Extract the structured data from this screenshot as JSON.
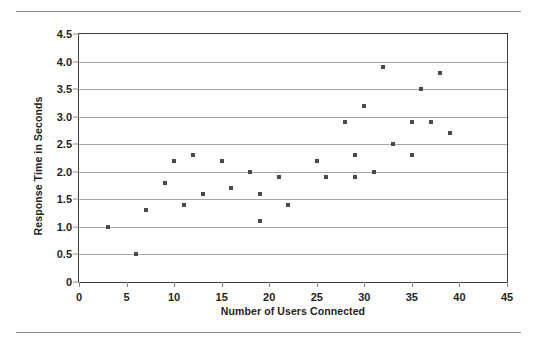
{
  "chart_data": {
    "type": "scatter",
    "title": "",
    "xlabel": "Number of Users Connected",
    "ylabel": "Response Time in Seconds",
    "xlim": [
      0,
      45
    ],
    "ylim": [
      0,
      4.5
    ],
    "xticks": [
      0,
      5,
      10,
      15,
      20,
      25,
      30,
      35,
      40,
      45
    ],
    "xtick_labels": [
      "0",
      "5",
      "10",
      "15",
      "20",
      "25",
      "30",
      "35",
      "40",
      "45"
    ],
    "yticks": [
      0,
      0.5,
      1.0,
      1.5,
      2.0,
      2.5,
      3.0,
      3.5,
      4.0,
      4.5
    ],
    "ytick_labels": [
      "0",
      "0.5",
      "1.0",
      "1.5",
      "2.0",
      "2.5",
      "3.0",
      "3.5",
      "4.0",
      "4.5"
    ],
    "grid": "horizontal",
    "legend": "none",
    "marker": "square",
    "marker_color": "#4a4a4a",
    "points": [
      {
        "x": 3,
        "y": 1.0
      },
      {
        "x": 6,
        "y": 0.5
      },
      {
        "x": 7,
        "y": 1.3
      },
      {
        "x": 9,
        "y": 1.8
      },
      {
        "x": 10,
        "y": 2.2
      },
      {
        "x": 11,
        "y": 1.4
      },
      {
        "x": 12,
        "y": 2.3
      },
      {
        "x": 13,
        "y": 1.6
      },
      {
        "x": 15,
        "y": 2.2
      },
      {
        "x": 16,
        "y": 1.7
      },
      {
        "x": 18,
        "y": 2.0
      },
      {
        "x": 19,
        "y": 1.6
      },
      {
        "x": 19,
        "y": 1.1
      },
      {
        "x": 21,
        "y": 1.9
      },
      {
        "x": 22,
        "y": 1.4
      },
      {
        "x": 25,
        "y": 2.2
      },
      {
        "x": 26,
        "y": 1.9
      },
      {
        "x": 28,
        "y": 2.9
      },
      {
        "x": 29,
        "y": 2.3
      },
      {
        "x": 29,
        "y": 1.9
      },
      {
        "x": 30,
        "y": 3.2
      },
      {
        "x": 31,
        "y": 2.0
      },
      {
        "x": 32,
        "y": 3.9
      },
      {
        "x": 33,
        "y": 2.5
      },
      {
        "x": 35,
        "y": 2.9
      },
      {
        "x": 35,
        "y": 2.3
      },
      {
        "x": 36,
        "y": 3.5
      },
      {
        "x": 37,
        "y": 2.9
      },
      {
        "x": 38,
        "y": 3.8
      },
      {
        "x": 39,
        "y": 2.7
      }
    ]
  }
}
